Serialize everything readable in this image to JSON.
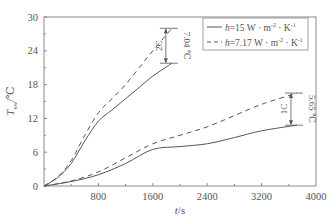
{
  "chart_data": {
    "type": "line",
    "title": "",
    "xlabel": "t/s",
    "ylabel": "T_sw/°C",
    "xlim": [
      0,
      4000
    ],
    "ylim": [
      0,
      30
    ],
    "xticks": [
      800,
      1600,
      2400,
      3200,
      4000
    ],
    "yticks": [
      0,
      6,
      12,
      18,
      24,
      30
    ],
    "grid": false,
    "legend_position": "upper right",
    "legend": [
      {
        "label": "h=15 W·m⁻²·K⁻¹",
        "style": "solid"
      },
      {
        "label": "h=7.17 W·m⁻²·K⁻¹",
        "style": "dashed"
      }
    ],
    "series": [
      {
        "name": "2C, h=15 W·m⁻²·K⁻¹",
        "style": "solid",
        "x": [
          0,
          200,
          400,
          600,
          800,
          1000,
          1200,
          1400,
          1600,
          1880
        ],
        "values": [
          0,
          1.5,
          4,
          8,
          11.5,
          13.5,
          15.5,
          17.5,
          19.5,
          21.8
        ]
      },
      {
        "name": "2C, h=7.17 W·m⁻²·K⁻¹",
        "style": "dashed",
        "x": [
          0,
          200,
          400,
          600,
          800,
          1000,
          1200,
          1400,
          1600,
          1880
        ],
        "values": [
          0,
          1.6,
          4.5,
          9,
          13,
          15.5,
          18,
          21,
          24,
          28.0
        ]
      },
      {
        "name": "1C, h=15 W·m⁻²·K⁻¹",
        "style": "solid",
        "x": [
          0,
          400,
          800,
          1200,
          1600,
          2000,
          2400,
          2800,
          3200,
          3720
        ],
        "values": [
          0,
          0.8,
          2,
          4,
          6.5,
          7,
          7.5,
          8.6,
          9.8,
          10.8
        ]
      },
      {
        "name": "1C, h=7.17 W·m⁻²·K⁻¹",
        "style": "dashed",
        "x": [
          0,
          400,
          800,
          1200,
          1600,
          2000,
          2400,
          2800,
          3200,
          3720
        ],
        "values": [
          0,
          0.9,
          2.5,
          5,
          7.5,
          9,
          10.5,
          12.5,
          14.5,
          16.5
        ]
      }
    ],
    "annotations": [
      {
        "rate": "2C",
        "difference": "7.04 ℃",
        "t": 1880,
        "from": 21.8,
        "to": 28.0
      },
      {
        "rate": "1C",
        "difference": "5.65 ℃",
        "t": 3720,
        "from": 10.8,
        "to": 16.5
      }
    ]
  },
  "labels": {
    "xlabel_italic": "t",
    "xlabel_unit": "/s",
    "ylabel_main": "T",
    "ylabel_sub": "sw",
    "ylabel_unit": "/℃",
    "legend_solid_prefix": "h",
    "legend_solid_text": "=15 W · m",
    "legend_solid_sup1": "-2",
    "legend_solid_tail": " · K",
    "legend_solid_sup2": "-1",
    "legend_dashed_prefix": "h",
    "legend_dashed_text": "=7.17 W · m",
    "legend_dashed_sup1": "-2",
    "legend_dashed_tail": " · K",
    "legend_dashed_sup2": "-1",
    "ann_2c_rate": "2C",
    "ann_2c_diff": "7.04 ℃",
    "ann_1c_rate": "1C",
    "ann_1c_diff": "5.65 ℃"
  },
  "colors": {
    "line": "#555555",
    "axis": "#777777"
  }
}
